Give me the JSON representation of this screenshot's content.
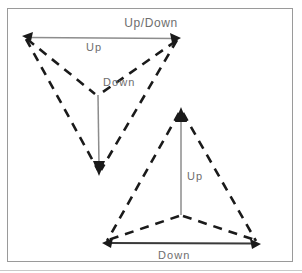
{
  "figure": {
    "title": "Up/Down",
    "frame": {
      "x": 7,
      "y": 8,
      "width": 286,
      "height": 254,
      "stroke_color": "#9a9a9a"
    },
    "baseline_rule": {
      "y": 270,
      "color": "#c9c9c9"
    },
    "colors": {
      "dashed_stroke": "#1a1a1a",
      "solid_arrow_stroke": "#8c8c8c",
      "arrowhead_fill": "#1a1a1a",
      "label_text": "#6e6e6e",
      "background": "#ffffff"
    },
    "shapes": [
      {
        "name": "upper-triangle",
        "orientation": "pointing-down",
        "vertices": {
          "left": [
            25,
            37
          ],
          "right": [
            178,
            38
          ],
          "bottom": [
            99,
            172
          ]
        },
        "center_junction": [
          97,
          95
        ],
        "dashed_edges": [
          "left-to-bottom",
          "right-to-bottom",
          "left-to-center",
          "right-to-center"
        ],
        "arrows": [
          {
            "name": "up-arrow-horizontal",
            "label": "Up",
            "label_position": [
              86,
              50
            ],
            "from": [
              25,
              37
            ],
            "to": [
              178,
              38
            ],
            "heads": "both",
            "direction": "horizontal"
          },
          {
            "name": "down-arrow-vertical",
            "label": "Down",
            "label_position": [
              103,
              85
            ],
            "from": [
              97,
              95
            ],
            "to": [
              99,
              172
            ],
            "heads": "end",
            "direction": "down"
          }
        ]
      },
      {
        "name": "lower-triangle",
        "orientation": "pointing-up",
        "vertices": {
          "apex": [
            181,
            110
          ],
          "bottom_left": [
            105,
            243
          ],
          "bottom_right": [
            258,
            243
          ]
        },
        "center_junction": [
          181,
          215
        ],
        "dashed_edges": [
          "apex-to-bottom-left",
          "apex-to-bottom-right",
          "center-to-bottom-left",
          "center-to-bottom-right"
        ],
        "arrows": [
          {
            "name": "up-arrow-vertical",
            "label": "Up",
            "label_position": [
              187,
              179
            ],
            "from": [
              181,
              215
            ],
            "to": [
              181,
              110
            ],
            "heads": "end",
            "direction": "up"
          },
          {
            "name": "down-arrow-horizontal",
            "label": "Down",
            "label_position": [
              158,
              258
            ],
            "from": [
              105,
              243
            ],
            "to": [
              258,
              243
            ],
            "heads": "both",
            "direction": "horizontal"
          }
        ]
      }
    ],
    "labels": [
      {
        "id": "title",
        "text": "Up/Down"
      },
      {
        "id": "upper-up",
        "text": "Up"
      },
      {
        "id": "upper-down",
        "text": "Down"
      },
      {
        "id": "lower-up",
        "text": "Up"
      },
      {
        "id": "lower-down",
        "text": "Down"
      }
    ]
  }
}
